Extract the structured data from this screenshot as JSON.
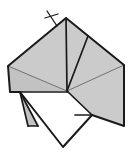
{
  "figure": {
    "type": "line-drawing",
    "canvas": {
      "width": 130,
      "height": 154
    },
    "colors": {
      "background": "#ffffff",
      "paper_shaded": "#cbcbcb",
      "paper_shaded_light": "#d4d4d4",
      "paper_shaded_dark": "#c2c2c2",
      "paper_white": "#ffffff",
      "outline": "#1a1a1a",
      "crease_thin": "#555555"
    },
    "stroke_widths": {
      "outline": 2.0,
      "fold_major": 1.7,
      "crease_thin": 0.8
    },
    "points": {
      "apex": [
        66,
        18
      ],
      "left_upper": [
        8,
        66
      ],
      "right_upper": [
        124,
        65
      ],
      "center": [
        67,
        91
      ],
      "left_edge_low": [
        10,
        92
      ],
      "white_top_left": [
        20,
        92
      ],
      "white_bottom_tip": [
        63,
        147
      ],
      "gray_flap_tip": [
        38,
        126
      ],
      "right_lower_tip": [
        124,
        126
      ],
      "right_notch": [
        92,
        115
      ],
      "left_crease_top": [
        88,
        36
      ]
    },
    "faces": [
      {
        "name": "upper-left-panel",
        "fill": "paper_shaded",
        "polygon": "66,18 8,66 67,91"
      },
      {
        "name": "upper-mid-panel",
        "fill": "paper_shaded_light",
        "polygon": "66,18 67,91 88,36"
      },
      {
        "name": "upper-right-panel",
        "fill": "paper_shaded",
        "polygon": "66,18 88,36 124,65 67,91"
      },
      {
        "name": "left-wing-panel",
        "fill": "paper_shaded_dark",
        "polygon": "8,66 10,92 67,91"
      },
      {
        "name": "right-lower-panel",
        "fill": "paper_shaded",
        "polygon": "67,91 124,65 124,126 92,115"
      },
      {
        "name": "left-narrow-flap",
        "fill": "paper_shaded_dark",
        "polygon": "20,92 38,126 28,126"
      },
      {
        "name": "white-front-panel",
        "fill": "paper_white",
        "polygon": "20,92 68,92 92,115 63,147"
      }
    ],
    "creases": [
      {
        "name": "apex-to-center",
        "from": [
          66,
          18
        ],
        "to": [
          67,
          91
        ],
        "weight": "fold_major"
      },
      {
        "name": "right-crease-to-center",
        "from": [
          88,
          36
        ],
        "to": [
          67,
          91
        ],
        "weight": "fold_major"
      },
      {
        "name": "left-vertex-to-center",
        "from": [
          8,
          66
        ],
        "to": [
          67,
          91
        ],
        "weight": "crease_thin"
      },
      {
        "name": "right-vertex-to-center",
        "from": [
          124,
          65
        ],
        "to": [
          67,
          91
        ],
        "weight": "crease_thin"
      },
      {
        "name": "white-panel-top-edge",
        "from": [
          20,
          92
        ],
        "to": [
          68,
          92
        ],
        "weight": "fold_major"
      },
      {
        "name": "notch-edge",
        "from": [
          67,
          91
        ],
        "to": [
          92,
          115
        ],
        "weight": "fold_major"
      },
      {
        "name": "notch-base",
        "from": [
          75,
          115
        ],
        "to": [
          92,
          115
        ],
        "weight": "fold_major"
      }
    ],
    "outline_path": "66,18 124,65 124,126 92,115 63,147 20,92 10,92 8,66",
    "marks": [
      {
        "name": "cross-mark",
        "kind": "cross",
        "center": [
          51,
          17
        ],
        "stem_from": [
          47,
          11
        ],
        "stem_to": [
          57,
          26
        ],
        "bar_from": [
          45,
          18
        ],
        "bar_to": [
          58,
          14
        ]
      }
    ]
  }
}
